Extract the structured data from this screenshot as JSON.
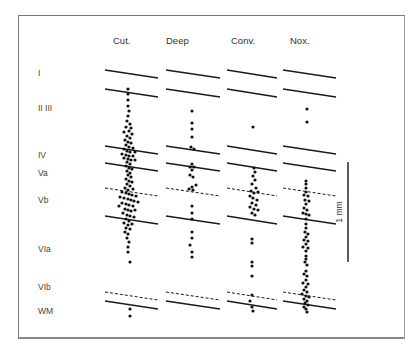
{
  "figure": {
    "columns": [
      {
        "id": "cut",
        "label": "Cut.",
        "x0": 105,
        "x1": 158,
        "hx": 113
      },
      {
        "id": "deep",
        "label": "Deep",
        "x0": 166,
        "x1": 220,
        "hx": 166
      },
      {
        "id": "conv",
        "label": "Conv.",
        "x0": 227,
        "x1": 277,
        "hx": 231
      },
      {
        "id": "nox",
        "label": "Nox.",
        "x0": 283,
        "x1": 336,
        "hx": 290
      }
    ],
    "layers": [
      {
        "label": "I",
        "y": 76
      },
      {
        "label": "II III",
        "y": 111
      },
      {
        "label": "IV",
        "y": 158
      },
      {
        "label": "Va",
        "y": 176
      },
      {
        "label": "Vb",
        "y": 203
      },
      {
        "label": "VIa",
        "y": 252
      },
      {
        "label": "VIb",
        "y": 290
      },
      {
        "label": "WM",
        "y": 314
      }
    ],
    "boundaries": [
      {
        "name": "pia",
        "y": 70,
        "style": "solid"
      },
      {
        "name": "I-II",
        "y": 89,
        "style": "solid"
      },
      {
        "name": "III-IV",
        "y": 146,
        "style": "solid"
      },
      {
        "name": "IV-Va",
        "y": 163,
        "style": "solid"
      },
      {
        "name": "Va-Vb",
        "y": 188,
        "style": "dashed"
      },
      {
        "name": "Vb-VIa",
        "y": 216,
        "style": "solid"
      },
      {
        "name": "VIa-VIb",
        "y": 292,
        "style": "dashed"
      },
      {
        "name": "VIb-WM",
        "y": 301,
        "style": "solid"
      }
    ],
    "slope": 8,
    "scale_bar": {
      "label": "1 mm",
      "x": 348,
      "y0": 162,
      "y1": 262
    }
  },
  "chart_data": {
    "type": "scatter",
    "title": "",
    "xlabel": "Cell class",
    "ylabel": "Cortical depth (layers)",
    "categories": [
      "Cut.",
      "Deep",
      "Conv.",
      "Nox."
    ],
    "layers": [
      "I",
      "II III",
      "IV",
      "Va",
      "Vb",
      "VIa",
      "VIb",
      "WM"
    ],
    "scale": "1 mm",
    "series": [
      {
        "name": "Cut.",
        "approx_count": 120,
        "distribution": "dense in II III–VIa, peak in Vb, 2 in WM"
      },
      {
        "name": "Deep",
        "approx_count": 25,
        "distribution": "sparse II III–VIa, none in VIb/WM"
      },
      {
        "name": "Conv.",
        "approx_count": 40,
        "distribution": "1 in II III, cluster Va–Vb, few VIa, few VIb"
      },
      {
        "name": "Nox.",
        "approx_count": 60,
        "distribution": "2 in II III, dense Va through VIb"
      }
    ]
  },
  "dots": {
    "cut": [
      [
        128,
        89
      ],
      [
        128,
        94
      ],
      [
        128,
        100
      ],
      [
        128,
        106
      ],
      [
        129,
        111
      ],
      [
        128,
        116
      ],
      [
        127,
        121
      ],
      [
        130,
        124
      ],
      [
        126,
        127
      ],
      [
        131,
        128
      ],
      [
        129,
        131
      ],
      [
        124,
        132
      ],
      [
        132,
        134
      ],
      [
        127,
        136
      ],
      [
        130,
        138
      ],
      [
        125,
        140
      ],
      [
        128,
        142
      ],
      [
        131,
        143
      ],
      [
        126,
        145
      ],
      [
        129,
        147
      ],
      [
        133,
        148
      ],
      [
        124,
        149
      ],
      [
        127,
        151
      ],
      [
        130,
        152
      ],
      [
        135,
        152
      ],
      [
        122,
        154
      ],
      [
        126,
        155
      ],
      [
        129,
        156
      ],
      [
        133,
        156
      ],
      [
        124,
        158
      ],
      [
        128,
        159
      ],
      [
        131,
        160
      ],
      [
        135,
        160
      ],
      [
        127,
        162
      ],
      [
        130,
        164
      ],
      [
        126,
        166
      ],
      [
        129,
        168
      ],
      [
        132,
        169
      ],
      [
        127,
        171
      ],
      [
        130,
        173
      ],
      [
        128,
        175
      ],
      [
        131,
        177
      ],
      [
        126,
        179
      ],
      [
        129,
        181
      ],
      [
        132,
        182
      ],
      [
        127,
        184
      ],
      [
        130,
        186
      ],
      [
        125,
        188
      ],
      [
        128,
        190
      ],
      [
        133,
        189
      ],
      [
        122,
        192
      ],
      [
        126,
        193
      ],
      [
        129,
        194
      ],
      [
        132,
        195
      ],
      [
        136,
        196
      ],
      [
        120,
        197
      ],
      [
        124,
        198
      ],
      [
        128,
        199
      ],
      [
        131,
        200
      ],
      [
        134,
        201
      ],
      [
        138,
        202
      ],
      [
        122,
        203
      ],
      [
        126,
        204
      ],
      [
        129,
        205
      ],
      [
        133,
        206
      ],
      [
        119,
        206
      ],
      [
        125,
        209
      ],
      [
        128,
        210
      ],
      [
        131,
        211
      ],
      [
        135,
        210
      ],
      [
        123,
        213
      ],
      [
        127,
        215
      ],
      [
        130,
        216
      ],
      [
        134,
        217
      ],
      [
        126,
        219
      ],
      [
        129,
        221
      ],
      [
        124,
        223
      ],
      [
        128,
        225
      ],
      [
        132,
        224
      ],
      [
        126,
        228
      ],
      [
        130,
        229
      ],
      [
        125,
        232
      ],
      [
        128,
        234
      ],
      [
        127,
        238
      ],
      [
        129,
        242
      ],
      [
        128,
        247
      ],
      [
        128,
        252
      ],
      [
        130,
        262
      ],
      [
        130,
        309
      ],
      [
        130,
        316
      ]
    ],
    "deep": [
      [
        192,
        111
      ],
      [
        192,
        123
      ],
      [
        192,
        129
      ],
      [
        192,
        137
      ],
      [
        191,
        147
      ],
      [
        194,
        149
      ],
      [
        190,
        167
      ],
      [
        194,
        167
      ],
      [
        192,
        164
      ],
      [
        192,
        170
      ],
      [
        190,
        175
      ],
      [
        193,
        177
      ],
      [
        196,
        185
      ],
      [
        192,
        187
      ],
      [
        189,
        189
      ],
      [
        193,
        190
      ],
      [
        192,
        206
      ],
      [
        192,
        213
      ],
      [
        192,
        219
      ],
      [
        192,
        232
      ],
      [
        192,
        238
      ],
      [
        190,
        245
      ],
      [
        192,
        252
      ],
      [
        192,
        257
      ]
    ],
    "conv": [
      [
        253,
        127
      ],
      [
        254,
        168
      ],
      [
        255,
        172
      ],
      [
        253,
        176
      ],
      [
        255,
        180
      ],
      [
        252,
        184
      ],
      [
        256,
        188
      ],
      [
        251,
        191
      ],
      [
        254,
        193
      ],
      [
        258,
        192
      ],
      [
        250,
        196
      ],
      [
        253,
        198
      ],
      [
        257,
        200
      ],
      [
        252,
        203
      ],
      [
        256,
        205
      ],
      [
        250,
        207
      ],
      [
        254,
        209
      ],
      [
        258,
        210
      ],
      [
        252,
        213
      ],
      [
        255,
        215
      ],
      [
        252,
        239
      ],
      [
        252,
        243
      ],
      [
        252,
        262
      ],
      [
        252,
        266
      ],
      [
        252,
        276
      ],
      [
        252,
        295
      ],
      [
        250,
        301
      ],
      [
        252,
        307
      ],
      [
        253,
        311
      ]
    ],
    "nox": [
      [
        307,
        109
      ],
      [
        307,
        122
      ],
      [
        306,
        181
      ],
      [
        306,
        184
      ],
      [
        306,
        188
      ],
      [
        306,
        192
      ],
      [
        304,
        195
      ],
      [
        308,
        196
      ],
      [
        305,
        200
      ],
      [
        309,
        201
      ],
      [
        306,
        204
      ],
      [
        304,
        208
      ],
      [
        307,
        210
      ],
      [
        303,
        213
      ],
      [
        306,
        214
      ],
      [
        309,
        215
      ],
      [
        306,
        219
      ],
      [
        306,
        224
      ],
      [
        306,
        228
      ],
      [
        305,
        232
      ],
      [
        308,
        234
      ],
      [
        306,
        237
      ],
      [
        304,
        240
      ],
      [
        308,
        241
      ],
      [
        306,
        244
      ],
      [
        303,
        247
      ],
      [
        308,
        248
      ],
      [
        306,
        251
      ],
      [
        306,
        256
      ],
      [
        306,
        259
      ],
      [
        305,
        262
      ],
      [
        307,
        265
      ],
      [
        306,
        271
      ],
      [
        304,
        274
      ],
      [
        307,
        276
      ],
      [
        306,
        280
      ],
      [
        303,
        283
      ],
      [
        308,
        284
      ],
      [
        306,
        287
      ],
      [
        304,
        290
      ],
      [
        307,
        292
      ],
      [
        302,
        294
      ],
      [
        306,
        296
      ],
      [
        309,
        297
      ],
      [
        304,
        299
      ],
      [
        307,
        301
      ],
      [
        305,
        303
      ],
      [
        308,
        305
      ],
      [
        304,
        307
      ],
      [
        306,
        309
      ],
      [
        307,
        312
      ]
    ]
  }
}
